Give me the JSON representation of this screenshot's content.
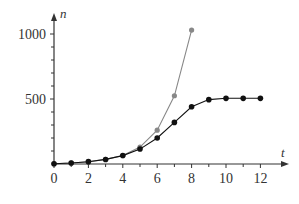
{
  "chart_data": {
    "type": "line",
    "title": "",
    "xlabel": "t",
    "ylabel": "n",
    "xlim": [
      0,
      13
    ],
    "ylim": [
      0,
      1150
    ],
    "x_ticks": [
      0,
      2,
      4,
      6,
      8,
      10,
      12
    ],
    "x_minor_ticks": [
      1,
      3,
      5,
      7,
      9,
      11
    ],
    "y_ticks": [
      500,
      1000
    ],
    "y_minor_ticks": [
      100,
      200,
      300,
      400,
      600,
      700,
      800,
      900
    ],
    "grid": false,
    "legend": null,
    "series": [
      {
        "name": "exponential",
        "color": "#888888",
        "marker": "circle-grey",
        "x": [
          0,
          1,
          2,
          3,
          4,
          5,
          6,
          7,
          8
        ],
        "y": [
          2,
          8,
          18,
          35,
          65,
          130,
          260,
          525,
          1030
        ]
      },
      {
        "name": "logistic",
        "color": "#111111",
        "marker": "circle-black",
        "x": [
          0,
          1,
          2,
          3,
          4,
          5,
          6,
          7,
          8,
          9,
          10,
          11,
          12
        ],
        "y": [
          2,
          8,
          18,
          35,
          65,
          115,
          200,
          320,
          440,
          495,
          505,
          505,
          505
        ]
      }
    ]
  }
}
